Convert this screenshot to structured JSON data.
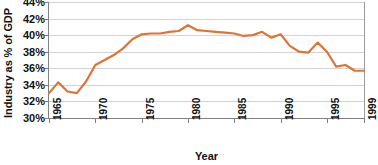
{
  "chart_data": {
    "type": "line",
    "title": "",
    "subtitle": "",
    "xlabel": "Year",
    "ylabel": "Industry as % of GDP",
    "xlim": [
      1965,
      1999
    ],
    "ylim": [
      30,
      44
    ],
    "ytick_labels": [
      "44%",
      "42%",
      "40%",
      "38%",
      "36%",
      "34%",
      "32%",
      "30%"
    ],
    "ytick_values": [
      44,
      42,
      40,
      38,
      36,
      34,
      32,
      30
    ],
    "xtick_labels": [
      "1965",
      "1970",
      "1975",
      "1980",
      "1985",
      "1990",
      "1995",
      "1999"
    ],
    "xtick_values": [
      1965,
      1970,
      1975,
      1980,
      1985,
      1990,
      1995,
      1999
    ],
    "grid": true,
    "grid_axis": "y",
    "legend": false,
    "legend_position": "none",
    "line_color": "#DD7436",
    "line_width": 2.2,
    "x": [
      1965,
      1966,
      1967,
      1968,
      1969,
      1970,
      1971,
      1972,
      1973,
      1974,
      1975,
      1976,
      1977,
      1978,
      1979,
      1980,
      1981,
      1982,
      1983,
      1984,
      1985,
      1986,
      1987,
      1988,
      1989,
      1990,
      1991,
      1992,
      1993,
      1994,
      1995,
      1996,
      1997,
      1998,
      1999
    ],
    "values": [
      33.0,
      34.3,
      33.2,
      33.0,
      34.4,
      36.4,
      37.0,
      37.6,
      38.4,
      39.5,
      40.1,
      40.2,
      40.2,
      40.4,
      40.5,
      41.2,
      40.6,
      40.5,
      40.4,
      40.3,
      40.2,
      39.9,
      40.0,
      40.4,
      39.7,
      40.1,
      38.7,
      38.0,
      37.9,
      39.1,
      38.0,
      36.2,
      36.4,
      35.7,
      35.7
    ],
    "series": [
      {
        "name": "Industry as % of GDP",
        "color": "#DD7436",
        "values": [
          33.0,
          34.3,
          33.2,
          33.0,
          34.4,
          36.4,
          37.0,
          37.6,
          38.4,
          39.5,
          40.1,
          40.2,
          40.2,
          40.4,
          40.5,
          41.2,
          40.6,
          40.5,
          40.4,
          40.3,
          40.2,
          39.9,
          40.0,
          40.4,
          39.7,
          40.1,
          38.7,
          38.0,
          37.9,
          39.1,
          38.0,
          36.2,
          36.4,
          35.7,
          35.7
        ]
      }
    ],
    "annotations": []
  },
  "axes": {
    "y_title": "Industry as % of GDP",
    "x_title": "Year"
  },
  "colors": {
    "line": "#DD7436",
    "grid": "#d4d4d4",
    "axis": "#808080",
    "text": "#111111",
    "background": "#ffffff"
  }
}
